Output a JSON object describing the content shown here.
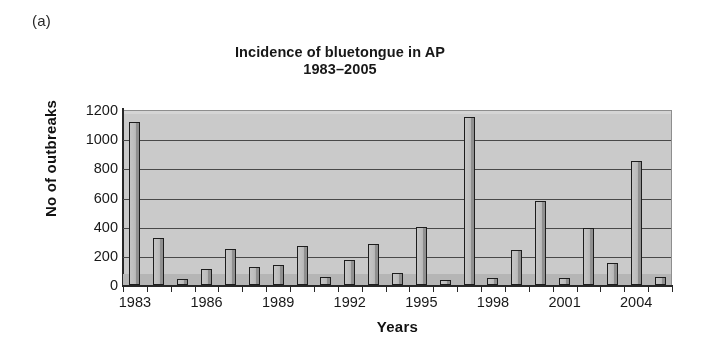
{
  "panel": {
    "label": "(a)"
  },
  "title": {
    "line1": "Incidence of bluetongue in AP",
    "line2": "1983–2005"
  },
  "axes": {
    "y_title": "No of outbreaks",
    "x_title": "Years",
    "y_ticks": [
      "1200",
      "1000",
      "800",
      "600",
      "400",
      "200",
      "0"
    ],
    "x_tick_labels": [
      "1983",
      "1986",
      "1989",
      "1992",
      "1995",
      "1998",
      "2001",
      "2004"
    ]
  },
  "colors": {
    "plot_background": "#c9c9c9",
    "bar_fill": "#bdbdbd",
    "bar_outline": "#1f1f1f",
    "gridline": "#4a4a4a",
    "axis": "#2a2a2a",
    "text": "#1c1a1a"
  },
  "chart_data": {
    "type": "bar",
    "title": "Incidence of bluetongue in AP 1983–2005",
    "xlabel": "Years",
    "ylabel": "No of outbreaks",
    "ylim": [
      0,
      1200
    ],
    "ytick_values": [
      0,
      200,
      400,
      600,
      800,
      1000,
      1200
    ],
    "grid": true,
    "legend": "none",
    "categories": [
      "1983",
      "1984",
      "1985",
      "1986",
      "1987",
      "1988",
      "1989",
      "1990",
      "1991",
      "1992",
      "1993",
      "1994",
      "1995",
      "1996",
      "1997",
      "1998",
      "1999",
      "2000",
      "2001",
      "2002",
      "2003",
      "2004",
      "2005"
    ],
    "values": [
      1120,
      320,
      40,
      110,
      245,
      125,
      135,
      270,
      55,
      170,
      280,
      80,
      400,
      35,
      1150,
      45,
      240,
      575,
      50,
      390,
      150,
      850,
      55
    ]
  }
}
